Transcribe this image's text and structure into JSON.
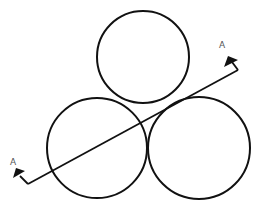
{
  "diagram": {
    "type": "section-view",
    "stroke_color": "#111111",
    "circles": [
      {
        "name": "top",
        "cx": 143,
        "cy": 57,
        "r": 46
      },
      {
        "name": "bottom-left",
        "cx": 97,
        "cy": 148,
        "r": 50
      },
      {
        "name": "bottom-right",
        "cx": 199,
        "cy": 148,
        "r": 51
      }
    ],
    "section_line": {
      "start": [
        28,
        184
      ],
      "end": [
        238,
        70
      ],
      "labels": {
        "left": "A",
        "right": "A"
      }
    }
  }
}
